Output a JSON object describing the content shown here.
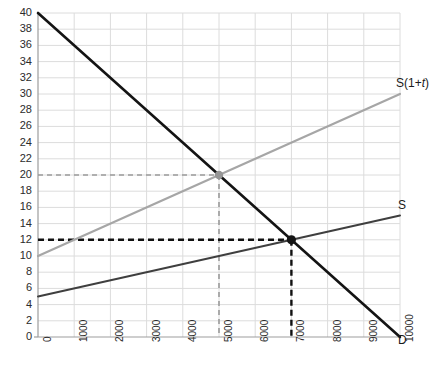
{
  "chart_data": {
    "type": "line",
    "title": "",
    "xlabel": "",
    "ylabel": "",
    "xlim": [
      0,
      10000
    ],
    "ylim": [
      0,
      40
    ],
    "grid": true,
    "legend_position": "inline-end-of-line",
    "x_ticks": [
      "0",
      "1000",
      "2000",
      "3000",
      "4000",
      "5000",
      "6000",
      "7000",
      "8000",
      "9000",
      "10000"
    ],
    "y_ticks": [
      "0",
      "2",
      "4",
      "6",
      "8",
      "10",
      "12",
      "14",
      "16",
      "18",
      "20",
      "22",
      "24",
      "26",
      "28",
      "30",
      "32",
      "34",
      "36",
      "38",
      "40"
    ],
    "series": [
      {
        "name": "D",
        "label": "D",
        "color": "#141414",
        "style": "solid",
        "width": 2.6,
        "points": [
          [
            0,
            40
          ],
          [
            10000,
            0
          ]
        ]
      },
      {
        "name": "S",
        "label": "S",
        "color": "#3f3f3f",
        "style": "solid",
        "width": 2.0,
        "points": [
          [
            0,
            5
          ],
          [
            10000,
            15
          ]
        ]
      },
      {
        "name": "S(1+t)",
        "label": "S(1+t)",
        "label_prefix": "S(1+",
        "label_italic": "t",
        "label_suffix": ")",
        "color": "#a6a6a6",
        "style": "solid",
        "width": 2.2,
        "points": [
          [
            0,
            10
          ],
          [
            10000,
            30
          ]
        ]
      }
    ],
    "annotations": [
      {
        "name": "equilibrium-with-tax",
        "x": 5000,
        "y": 20,
        "marker": "filled-circle",
        "color": "#969696",
        "radius": 4.2,
        "guides": {
          "style": "dashed",
          "color": "#9a9a9a",
          "to_x_axis": true,
          "to_y_axis": true
        }
      },
      {
        "name": "equilibrium-no-tax",
        "x": 7000,
        "y": 12,
        "marker": "filled-circle",
        "color": "#141414",
        "radius": 4.6,
        "guides": {
          "style": "dashed",
          "color": "#111111",
          "to_x_axis": true,
          "to_y_axis": true
        }
      }
    ],
    "colors": {
      "grid": "#dcdcdc",
      "axis": "#9d9d9d",
      "background": "#ffffff",
      "tick_text": "#2b2b2b"
    },
    "plot_box": {
      "left": 38,
      "right": 400,
      "top": 13,
      "bottom": 337
    }
  }
}
